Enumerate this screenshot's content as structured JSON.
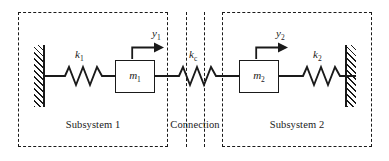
{
  "diagram": {
    "ink_color": "#1a1a1a",
    "background": "#ffffff"
  },
  "regions": [
    {
      "id": "subsystem-1",
      "label": "Subsystem 1"
    },
    {
      "id": "connection",
      "label": "Connection"
    },
    {
      "id": "subsystem-2",
      "label": "Subsystem 2"
    }
  ],
  "springs": [
    {
      "id": "k1",
      "symbol": "k",
      "subscript": "1"
    },
    {
      "id": "kc",
      "symbol": "k",
      "subscript": "c"
    },
    {
      "id": "k2",
      "symbol": "k",
      "subscript": "2"
    }
  ],
  "masses": [
    {
      "id": "m1",
      "symbol": "m",
      "subscript": "1"
    },
    {
      "id": "m2",
      "symbol": "m",
      "subscript": "2"
    }
  ],
  "displacements": [
    {
      "id": "y1",
      "symbol": "y",
      "subscript": "1",
      "direction": "right"
    },
    {
      "id": "y2",
      "symbol": "y",
      "subscript": "2",
      "direction": "right"
    }
  ],
  "supports": [
    {
      "id": "wall-left",
      "type": "fixed-wall",
      "hatch_side": "left"
    },
    {
      "id": "wall-right",
      "type": "fixed-wall",
      "hatch_side": "right"
    }
  ]
}
